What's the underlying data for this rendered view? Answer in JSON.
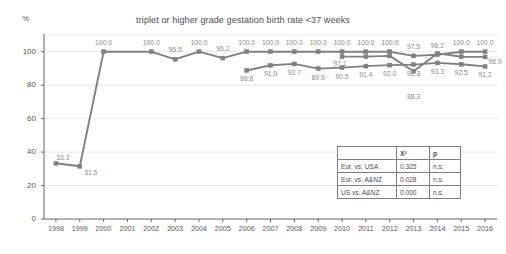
{
  "axis": {
    "y_unit": "%",
    "y_ticks": [
      "0",
      "20",
      "40",
      "60",
      "80",
      "100"
    ],
    "x_ticks": [
      "1998",
      "1999",
      "2000",
      "2001",
      "2002",
      "2003",
      "2004",
      "2005",
      "2006",
      "2007",
      "2008",
      "2009",
      "2010",
      "2011",
      "2012",
      "2013",
      "2014",
      "2015",
      "2016"
    ]
  },
  "table": {
    "corner": "",
    "headers": [
      "Χ²",
      "p"
    ],
    "rows": [
      {
        "label": "Eur. vs. USA",
        "x2": "0.325",
        "p": "n.s."
      },
      {
        "label": "Eur. vs. A&NZ",
        "x2": "0.028",
        "p": "n.s."
      },
      {
        "label": "US vs. A&NZ",
        "x2": "0.000",
        "p": "n.s."
      }
    ]
  },
  "chart_data": {
    "type": "line",
    "title": "triplet or higher grade gestation birth rate <37 weeks",
    "xlabel": "",
    "ylabel": "%",
    "ylim": [
      0,
      110
    ],
    "yticks": [
      0,
      20,
      40,
      60,
      80,
      100
    ],
    "grid": true,
    "legend": "none",
    "line_color": "#808080",
    "marker_color": "#808080",
    "label_color": "#8c8c8c",
    "x": [
      "1998",
      "1999",
      "2000",
      "2001",
      "2002",
      "2003",
      "2004",
      "2005",
      "2006",
      "2007",
      "2008",
      "2009",
      "2010",
      "2011",
      "2012",
      "2013",
      "2014",
      "2015",
      "2016"
    ],
    "series": [
      {
        "name": "Europe",
        "values": [
          33.3,
          31.5,
          100.0,
          null,
          100.0,
          95.5,
          100.0,
          96.2,
          100.0,
          100.0,
          100.0,
          100.0,
          100.0,
          100.0,
          100.0,
          97.5,
          98.2,
          100.0,
          100.0
        ],
        "labels": [
          "33.3",
          "31.5",
          "100.0",
          null,
          "100.0",
          "95.5",
          "100.0",
          "96.2",
          "100.0",
          "100.0",
          "100.0",
          "100.0",
          "100.0",
          "100.0",
          "100.0",
          "97.5",
          "98.2",
          "100.0",
          "100.0"
        ]
      },
      {
        "name": "USA",
        "values": [
          null,
          null,
          null,
          null,
          null,
          null,
          null,
          null,
          88.8,
          91.9,
          92.7,
          89.9,
          90.5,
          91.4,
          92.0,
          92.3,
          93.3,
          92.5,
          91.2
        ],
        "labels": [
          null,
          null,
          null,
          null,
          null,
          null,
          null,
          null,
          "88.8",
          "91.9",
          "92.7",
          "89.9",
          "90.5",
          "91.4",
          "92.0",
          "92.3",
          "93.3",
          "92.5",
          "91.2"
        ]
      },
      {
        "name": "A&NZ",
        "values": [
          null,
          null,
          null,
          null,
          null,
          null,
          null,
          null,
          null,
          null,
          null,
          null,
          97.1,
          97.1,
          97.5,
          88.3,
          99.0,
          97.0,
          96.9
        ],
        "labels": [
          null,
          null,
          null,
          null,
          null,
          null,
          null,
          null,
          null,
          null,
          null,
          null,
          "97.1",
          null,
          null,
          "88.3",
          null,
          null,
          "96.9"
        ]
      }
    ]
  }
}
